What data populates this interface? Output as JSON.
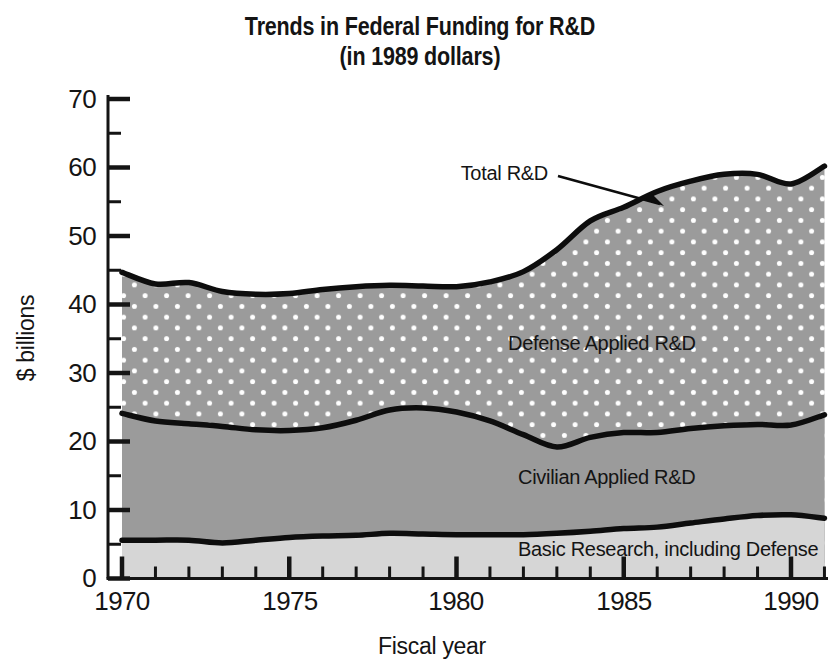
{
  "chart_data": {
    "type": "area",
    "title": "Trends in Federal Funding for R&D",
    "subtitle": "(in 1989 dollars)",
    "xlabel": "Fiscal year",
    "ylabel": "$ billions",
    "xlim": [
      1970,
      1991
    ],
    "ylim": [
      0,
      70
    ],
    "grid": false,
    "legend_position": "inline-annotations",
    "stacked": true,
    "x_major_ticks": [
      1970,
      1975,
      1980,
      1985,
      1990
    ],
    "x_major_tick_labels": [
      "1970",
      "1975",
      "1980",
      "1985",
      "1990"
    ],
    "x_minor_tick_step": 1,
    "y_major_ticks": [
      0,
      10,
      20,
      30,
      40,
      50,
      60,
      70
    ],
    "y_major_tick_labels": [
      "0",
      "10",
      "20",
      "30",
      "40",
      "50",
      "60",
      "70"
    ],
    "y_minor_ticks": [
      5,
      15,
      25,
      35,
      45,
      55,
      65
    ],
    "x": [
      1970,
      1971,
      1972,
      1973,
      1974,
      1975,
      1976,
      1977,
      1978,
      1979,
      1980,
      1981,
      1982,
      1983,
      1984,
      1985,
      1986,
      1987,
      1988,
      1989,
      1990,
      1991
    ],
    "series": [
      {
        "name": "Basic Research, including Defense",
        "label": "Basic Research, including Defense",
        "color": "#d6d6d6",
        "pattern": "solid",
        "values": [
          5.6,
          5.6,
          5.6,
          5.2,
          5.6,
          6.0,
          6.2,
          6.3,
          6.6,
          6.5,
          6.4,
          6.4,
          6.4,
          6.6,
          6.9,
          7.3,
          7.5,
          8.1,
          8.7,
          9.2,
          9.3,
          8.8
        ]
      },
      {
        "name": "Civilian Applied R&D",
        "label": "Civilian Applied R&D",
        "color": "#9b9b9b",
        "pattern": "solid",
        "cumulative_top": [
          24.1,
          23.0,
          22.6,
          22.2,
          21.7,
          21.6,
          22.0,
          23.1,
          24.6,
          24.9,
          24.3,
          23.0,
          21.0,
          19.2,
          20.6,
          21.3,
          21.3,
          21.9,
          22.3,
          22.5,
          22.4,
          23.9
        ]
      },
      {
        "name": "Defense Applied R&D",
        "label": "Defense Applied R&D",
        "color": "#9b9b9b",
        "pattern": "white-dots",
        "cumulative_top": [
          44.7,
          43.0,
          43.2,
          41.9,
          41.5,
          41.6,
          42.2,
          42.6,
          42.8,
          42.7,
          42.6,
          43.3,
          44.8,
          48.0,
          52.2,
          54.2,
          56.5,
          58.0,
          59.0,
          59.0,
          57.6,
          60.2
        ]
      }
    ],
    "annotations": [
      {
        "name": "total-rd-annotation",
        "text": "Total R&D",
        "arrow": true,
        "points_to_year": 1986
      }
    ]
  },
  "labels": {
    "title": "Trends in Federal Funding for R&D",
    "subtitle": "(in 1989 dollars)",
    "y_axis_title": "$ billions",
    "x_axis_title": "Fiscal year",
    "total_rd": "Total R&D",
    "defense_applied": "Defense Applied R&D",
    "civilian_applied": "Civilian Applied R&D",
    "basic_research": "Basic Research, including Defense"
  },
  "y_ticks": {
    "t0": "0",
    "t10": "10",
    "t20": "20",
    "t30": "30",
    "t40": "40",
    "t50": "50",
    "t60": "60",
    "t70": "70"
  },
  "x_ticks": {
    "t1970": "1970",
    "t1975": "1975",
    "t1980": "1980",
    "t1985": "1985",
    "t1990": "1990"
  },
  "colors": {
    "top_band": "#9b9b9b",
    "middle_band": "#9b9b9b",
    "bottom_band": "#d6d6d6",
    "line": "#0d0d0d",
    "text": "#141414",
    "background": "#ffffff"
  }
}
